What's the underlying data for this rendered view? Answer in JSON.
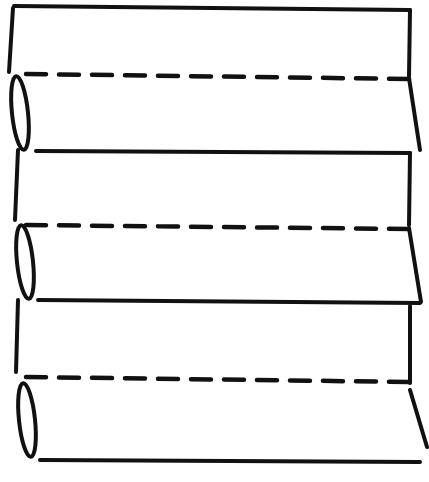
{
  "figure": {
    "stroke_color": "#111111",
    "background": "#ffffff",
    "panels": 6,
    "folds": 3
  }
}
